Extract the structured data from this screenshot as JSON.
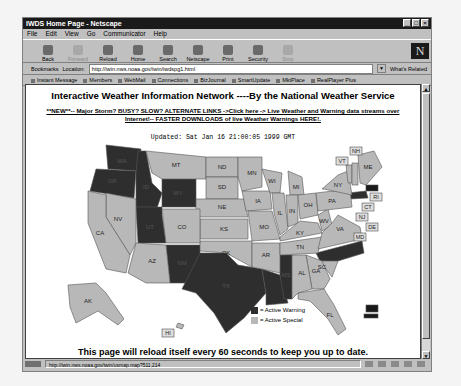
{
  "window": {
    "title": "IWDS Home Page - Netscape",
    "controls": [
      "_",
      "□",
      "×"
    ]
  },
  "menu": [
    "File",
    "Edit",
    "View",
    "Go",
    "Communicator",
    "Help"
  ],
  "toolbar": {
    "buttons": [
      {
        "label": "Back",
        "icon": "back-arrow-icon",
        "enabled": true
      },
      {
        "label": "Forward",
        "icon": "forward-arrow-icon",
        "enabled": false
      },
      {
        "label": "Reload",
        "icon": "reload-icon",
        "enabled": true
      },
      {
        "label": "Home",
        "icon": "home-icon",
        "enabled": true
      },
      {
        "label": "Search",
        "icon": "search-icon",
        "enabled": true
      },
      {
        "label": "Netscape",
        "icon": "netscape-icon",
        "enabled": true
      },
      {
        "label": "Print",
        "icon": "print-icon",
        "enabled": true
      },
      {
        "label": "Security",
        "icon": "lock-icon",
        "enabled": true
      },
      {
        "label": "Stop",
        "icon": "stop-icon",
        "enabled": false
      }
    ],
    "logo": "N"
  },
  "location": {
    "bookmarks_label": "Bookmarks",
    "location_label": "Location:",
    "url": "http://iwin.nws.noaa.gov/iwin/iwdspg1.html",
    "whats_related": "What's Related"
  },
  "personal_toolbar": [
    "Instant Message",
    "Members",
    "WebMail",
    "Connections",
    "BizJournal",
    "SmartUpdate",
    "MktPlace",
    "RealPlayer Plus"
  ],
  "page": {
    "heading": "Interactive Weather Information Network ----By the National Weather Service",
    "alert_link": "**NEW**-- Major Storm? BUSY? SLOW? ALTERNATE LINKS ->Click here -> Live Weather and Warning data streams over Internet!-- FASTER DOWNLOADS of live Weather Warnings HERE!.",
    "updated": "Updated: Sat Jan 16 21:00:05 1999 GMT",
    "reload_note": "This page will reload itself every 60 seconds to keep you up to date.",
    "legend": {
      "warning_label": "= Active Warning",
      "special_label": "= Active Special",
      "warning_color": "#2e2e2e",
      "special_color": "#b8b8b8"
    },
    "states": [
      "WA",
      "OR",
      "ID",
      "MT",
      "WY",
      "ND",
      "SD",
      "NE",
      "MN",
      "WI",
      "MI",
      "IA",
      "IL",
      "IN",
      "OH",
      "PA",
      "NY",
      "VT",
      "NH",
      "ME",
      "MA",
      "RI",
      "CT",
      "NJ",
      "DE",
      "MD",
      "WV",
      "VA",
      "KY",
      "TN",
      "NC",
      "SC",
      "GA",
      "AL",
      "MS",
      "LA",
      "AR",
      "MO",
      "KS",
      "OK",
      "TX",
      "NM",
      "CO",
      "UT",
      "AZ",
      "NV",
      "CA",
      "AK",
      "HI",
      "FL"
    ]
  },
  "statusbar": {
    "url": "http://iwin.nws.noaa.gov/iwin/usmap.map?511,214"
  }
}
